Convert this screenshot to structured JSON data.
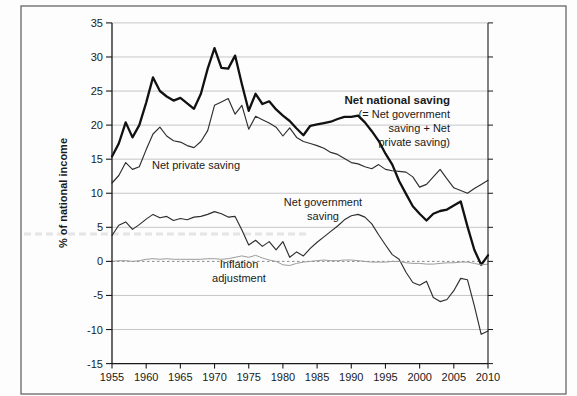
{
  "figure": {
    "y_axis_label": "% of national income",
    "annotations": {
      "private_label": "Net private saving",
      "national_line1": "Net national saving",
      "national_line2": "(= Net government",
      "national_line3": "saving + Net",
      "national_line4": "private saving)",
      "government_line1": "Net government",
      "government_line2": "saving",
      "inflation_line1": "Inflation",
      "inflation_line2": "adjustment"
    }
  },
  "chart_data": {
    "type": "line",
    "title": "",
    "xlabel": "",
    "ylabel": "% of national income",
    "xlim": [
      1955,
      2010
    ],
    "ylim": [
      -15,
      35
    ],
    "x_ticks": [
      1955,
      1960,
      1965,
      1970,
      1975,
      1980,
      1985,
      1990,
      1995,
      2000,
      2005,
      2010
    ],
    "y_ticks": [
      35,
      30,
      25,
      20,
      15,
      10,
      5,
      0,
      -5,
      -10,
      -15
    ],
    "grid": true,
    "legend_position": "inline-annotations",
    "x": [
      1955,
      1956,
      1957,
      1958,
      1959,
      1960,
      1961,
      1962,
      1963,
      1964,
      1965,
      1966,
      1967,
      1968,
      1969,
      1970,
      1971,
      1972,
      1973,
      1974,
      1975,
      1976,
      1977,
      1978,
      1979,
      1980,
      1981,
      1982,
      1983,
      1984,
      1985,
      1986,
      1987,
      1988,
      1989,
      1990,
      1991,
      1992,
      1993,
      1994,
      1995,
      1996,
      1997,
      1998,
      1999,
      2000,
      2001,
      2002,
      2003,
      2004,
      2005,
      2006,
      2007,
      2008,
      2009,
      2010
    ],
    "series": [
      {
        "name": "Net national saving",
        "style": "bold",
        "values": [
          15.4,
          17.3,
          20.4,
          18.2,
          20.0,
          23.3,
          27.0,
          25.0,
          24.2,
          23.6,
          24.0,
          23.2,
          22.4,
          24.6,
          28.3,
          31.3,
          28.4,
          28.3,
          30.2,
          26.0,
          22.1,
          24.6,
          23.1,
          23.5,
          22.3,
          21.4,
          20.6,
          19.5,
          18.5,
          19.9,
          20.1,
          20.3,
          20.5,
          20.9,
          21.2,
          21.2,
          21.4,
          20.4,
          19.1,
          17.7,
          15.8,
          14.2,
          11.8,
          9.9,
          8.1,
          7.0,
          6.0,
          7.0,
          7.4,
          7.6,
          8.2,
          8.8,
          5.1,
          1.7,
          -0.5,
          0.9
        ]
      },
      {
        "name": "Net private saving",
        "style": "thin",
        "values": [
          11.5,
          12.6,
          14.5,
          13.5,
          13.9,
          16.4,
          18.7,
          19.7,
          18.4,
          17.7,
          17.5,
          17.0,
          16.7,
          17.6,
          19.2,
          22.9,
          23.4,
          23.9,
          21.6,
          22.9,
          19.4,
          21.3,
          20.8,
          20.3,
          19.7,
          18.4,
          19.6,
          18.2,
          17.6,
          17.3,
          17.0,
          16.6,
          16.0,
          15.7,
          15.1,
          14.5,
          14.3,
          13.9,
          13.6,
          14.2,
          13.5,
          13.3,
          13.2,
          13.1,
          12.4,
          10.9,
          11.3,
          12.4,
          13.5,
          12.1,
          10.8,
          10.4,
          10.0,
          10.7,
          11.3,
          11.9
        ]
      },
      {
        "name": "Net government saving",
        "style": "thin",
        "values": [
          3.8,
          5.3,
          5.8,
          4.7,
          5.4,
          6.2,
          6.9,
          6.4,
          6.6,
          6.0,
          6.3,
          6.1,
          6.5,
          6.6,
          6.9,
          7.3,
          7.0,
          6.5,
          6.6,
          4.6,
          2.4,
          3.1,
          2.2,
          2.9,
          1.7,
          2.9,
          0.6,
          1.4,
          0.8,
          1.9,
          2.8,
          3.6,
          4.4,
          5.2,
          6.1,
          6.7,
          6.9,
          6.5,
          5.5,
          3.9,
          2.4,
          1.0,
          0.3,
          -1.6,
          -3.1,
          -3.5,
          -2.9,
          -5.3,
          -5.9,
          -5.6,
          -4.3,
          -2.5,
          -2.7,
          -6.5,
          -10.7,
          -10.2
        ]
      },
      {
        "name": "Inflation adjustment",
        "style": "faint",
        "values": [
          0.0,
          0.1,
          0.1,
          0.0,
          0.1,
          0.3,
          0.4,
          0.3,
          0.4,
          0.3,
          0.3,
          0.3,
          0.3,
          0.3,
          0.4,
          0.4,
          0.3,
          0.4,
          0.6,
          0.8,
          0.6,
          0.9,
          0.5,
          0.2,
          0.0,
          -0.5,
          -0.6,
          -0.3,
          -0.1,
          0.0,
          0.1,
          0.2,
          0.1,
          0.1,
          0.2,
          0.2,
          0.1,
          0.0,
          -0.1,
          -0.1,
          -0.1,
          0.0,
          0.0,
          -0.2,
          -0.3,
          -0.3,
          -0.4,
          -0.4,
          -0.3,
          -0.2,
          -0.2,
          -0.1,
          -0.1,
          -0.3,
          -0.5,
          -0.4
        ]
      }
    ]
  }
}
